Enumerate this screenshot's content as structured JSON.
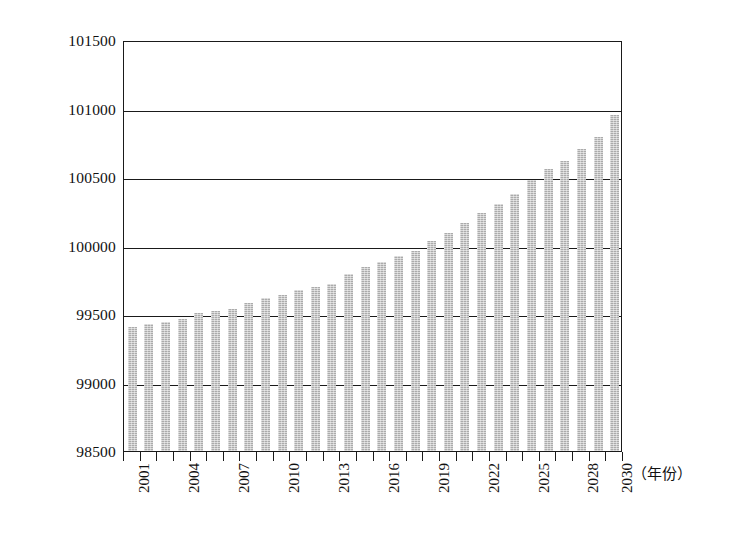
{
  "chart_data": {
    "type": "bar",
    "title": "",
    "xlabel": "（年份）",
    "ylabel": "",
    "ylim": [
      98500,
      101500
    ],
    "ytick_step": 500,
    "ytick_labels": [
      "101500",
      "101000",
      "100500",
      "100000",
      "99500",
      "99000",
      "98500"
    ],
    "ytick_values": [
      101500,
      101000,
      100500,
      100000,
      99500,
      99000,
      98500
    ],
    "grid": true,
    "grid_axis": "y",
    "legend": "none",
    "bar_color": "#ababab",
    "axis_color": "#1a1a1a",
    "background": "#ffffff",
    "xtick_label_rotation": 90,
    "xtick_labels_shown": [
      "2001",
      "2004",
      "2007",
      "2010",
      "2013",
      "2016",
      "2019",
      "2022",
      "2025",
      "2028",
      "2030"
    ],
    "categories": [
      "2001",
      "2002",
      "2003",
      "2004",
      "2005",
      "2006",
      "2007",
      "2008",
      "2009",
      "2010",
      "2011",
      "2012",
      "2013",
      "2014",
      "2015",
      "2016",
      "2017",
      "2018",
      "2019",
      "2020",
      "2021",
      "2022",
      "2023",
      "2024",
      "2025",
      "2026",
      "2027",
      "2028",
      "2029",
      "2030"
    ],
    "values": [
      99405,
      99425,
      99440,
      99465,
      99510,
      99520,
      99540,
      99580,
      99620,
      99640,
      99675,
      99700,
      99720,
      99790,
      99840,
      99880,
      99925,
      99960,
      100030,
      100095,
      100165,
      100235,
      100305,
      100375,
      100480,
      100555,
      100620,
      100705,
      100795,
      100950
    ]
  }
}
